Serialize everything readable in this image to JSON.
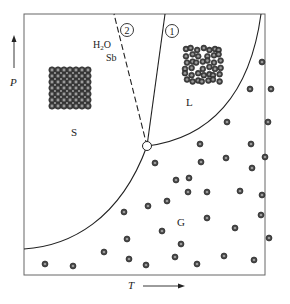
{
  "diagram": {
    "colors": {
      "line": "#222222",
      "frame": "#555555",
      "particle_fill": "#444444",
      "particle_ring": "#222222",
      "particle_center": "#9a9a9a",
      "background": "#ffffff"
    },
    "axes": {
      "y_label": "P",
      "x_label": "T"
    },
    "regions": {
      "solid": "S",
      "liquid": "L",
      "gas": "G"
    },
    "curves": {
      "fusion_marker": "1",
      "anomalous_fusion_marker": "2",
      "anomalous_note_line1": "H2O",
      "anomalous_note_line2": "Sb"
    },
    "triple_point": {
      "x": 147,
      "y": 146
    },
    "frame": {
      "x": 24,
      "y": 14,
      "width": 241,
      "height": 261
    },
    "gas_particles": [
      [
        262,
        62
      ],
      [
        250,
        89
      ],
      [
        271,
        89
      ],
      [
        227,
        122
      ],
      [
        268,
        122
      ],
      [
        200,
        144
      ],
      [
        251,
        144
      ],
      [
        201,
        162
      ],
      [
        226,
        158
      ],
      [
        252,
        168
      ],
      [
        265,
        157
      ],
      [
        189,
        178
      ],
      [
        155,
        163
      ],
      [
        176,
        180
      ],
      [
        188,
        192
      ],
      [
        207,
        192
      ],
      [
        240,
        191
      ],
      [
        262,
        195
      ],
      [
        148,
        206
      ],
      [
        167,
        201
      ],
      [
        207,
        218
      ],
      [
        235,
        228
      ],
      [
        261,
        215
      ],
      [
        162,
        231
      ],
      [
        181,
        244
      ],
      [
        269,
        238
      ],
      [
        124,
        212
      ],
      [
        127,
        239
      ],
      [
        104,
        252
      ],
      [
        129,
        259
      ],
      [
        175,
        257
      ],
      [
        146,
        265
      ],
      [
        197,
        264
      ],
      [
        224,
        256
      ],
      [
        254,
        260
      ],
      [
        45,
        264
      ],
      [
        73,
        266
      ]
    ],
    "solid_lattice": {
      "x": 49,
      "y": 67,
      "rows": 7,
      "cols": 7,
      "spacing": 6
    },
    "liquid_cluster": {
      "x": 183,
      "y": 46,
      "count": 42
    }
  }
}
